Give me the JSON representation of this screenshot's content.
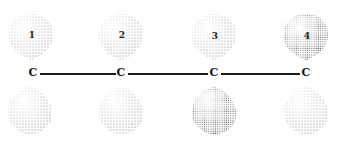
{
  "diagram": {
    "type": "p-orbital overlap diagram",
    "atoms": [
      {
        "label": "C",
        "number": "1",
        "x": 33
      },
      {
        "label": "C",
        "number": "2",
        "x": 121
      },
      {
        "label": "C",
        "number": "3",
        "x": 214
      },
      {
        "label": "C",
        "number": "4",
        "x": 306
      }
    ],
    "bonds": [
      {
        "from": 0,
        "to": 1
      },
      {
        "from": 1,
        "to": 2
      },
      {
        "from": 2,
        "to": 3
      }
    ],
    "colors": {
      "ink": "#1a1a1a",
      "stipple": "#4a4a4a",
      "background": "#ffffff"
    }
  }
}
